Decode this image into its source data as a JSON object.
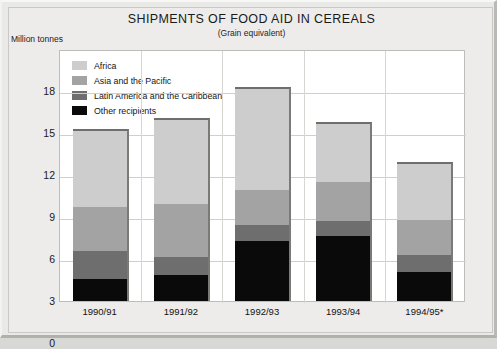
{
  "chart_data": {
    "type": "bar",
    "stacked": true,
    "title": "SHIPMENTS OF FOOD AID IN CEREALS",
    "subtitle": "(Grain equivalent)",
    "ylabel": "Million tonnes",
    "xlabel": "",
    "ylim": [
      0,
      18
    ],
    "yticks": [
      0,
      3,
      6,
      9,
      12,
      15,
      18
    ],
    "grid": true,
    "legend_position": "top-left inside plot",
    "categories": [
      "1990/91",
      "1991/92",
      "1992/93",
      "1993/94",
      "1994/95*"
    ],
    "series": [
      {
        "name": "Other recipients",
        "color": "#0a0a0a",
        "values": [
          1.6,
          1.9,
          4.3,
          4.7,
          2.1
        ]
      },
      {
        "name": "Latin America and the Caribbean",
        "color": "#6e6e6e",
        "values": [
          2.0,
          1.3,
          1.2,
          1.1,
          1.2
        ]
      },
      {
        "name": "Asia and the Pacific",
        "color": "#a3a3a3",
        "values": [
          3.2,
          3.8,
          2.5,
          2.8,
          2.6
        ]
      },
      {
        "name": "Africa",
        "color": "#cdcdcd",
        "values": [
          5.5,
          6.1,
          7.3,
          4.2,
          4.0
        ]
      }
    ],
    "totals": [
      12.3,
      13.1,
      15.3,
      12.8,
      9.9
    ],
    "footnote_marker": "*"
  },
  "colors": {
    "africa": "#cdcdcd",
    "asia": "#a3a3a3",
    "latin_america": "#6e6e6e",
    "other": "#0a0a0a",
    "plot_background": "#ffffff",
    "panel_background": "#edecea",
    "gridline": "#cfcfcc"
  }
}
